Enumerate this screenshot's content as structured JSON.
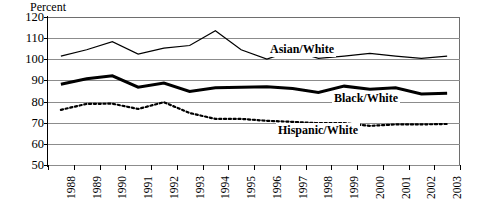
{
  "chart_data": {
    "type": "line",
    "title": "",
    "xlabel": "",
    "ylabel": "Percent",
    "ylim": [
      50,
      120
    ],
    "ytick_step": 10,
    "yticks": [
      120,
      110,
      100,
      90,
      80,
      70,
      60,
      50
    ],
    "grid": true,
    "legend_position": "inline-annotations",
    "categories": [
      "1988",
      "1989",
      "1990",
      "1991",
      "1992",
      "1993",
      "1994",
      "1995",
      "1996",
      "1997",
      "1998",
      "1999",
      "2000",
      "2001",
      "2002",
      "2003"
    ],
    "series": [
      {
        "name": "Asian/White",
        "style": "thin-solid",
        "color": "#000000",
        "values": [
          101.5,
          104.5,
          108.3,
          102.5,
          105.3,
          106.5,
          113.5,
          104.5,
          100.1,
          104.2,
          100.4,
          101.5,
          102.8,
          101.5,
          100.4,
          101.5
        ]
      },
      {
        "name": "Black/White",
        "style": "thick-solid",
        "color": "#000000",
        "values": [
          88.2,
          90.8,
          92.2,
          86.8,
          88.8,
          84.8,
          86.5,
          86.8,
          87.0,
          86.2,
          84.3,
          87.3,
          85.8,
          86.5,
          83.6,
          83.9
        ]
      },
      {
        "name": "Hispanic/White",
        "style": "dotted",
        "color": "#000000",
        "values": [
          76.1,
          78.9,
          79.0,
          76.5,
          79.7,
          74.6,
          71.8,
          71.8,
          70.9,
          70.4,
          69.8,
          69.8,
          68.5,
          69.2,
          69.2,
          69.4
        ]
      }
    ],
    "annotations": [
      {
        "text": "Asian/White",
        "series": "Asian/White"
      },
      {
        "text": "Black/White",
        "series": "Black/White"
      },
      {
        "text": "Hispanic/White",
        "series": "Hispanic/White"
      }
    ]
  },
  "axis": {
    "y_title": "Percent"
  },
  "colors": {
    "gridline": "#8c8c8c",
    "axis": "#000000",
    "series": "#000000",
    "background": "#ffffff"
  }
}
